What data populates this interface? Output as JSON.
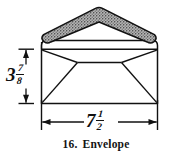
{
  "figure": {
    "caption_number": "16.",
    "caption_text": "Envelope",
    "object_name": "envelope",
    "line_color": "#111111",
    "flap_fill_color": "#9a9a9a",
    "background_color": "#ffffff"
  },
  "dimensions": {
    "height": {
      "whole": "3",
      "numerator": "7",
      "denominator": "8",
      "full_text": "3 7/8",
      "orientation": "vertical",
      "arrow_style": "double-arrow-with-extension-ticks"
    },
    "width": {
      "whole": "7",
      "numerator": "1",
      "denominator": "2",
      "full_text": "7 1/2",
      "orientation": "horizontal",
      "arrow_style": "double-arrow-with-extension-ticks"
    }
  },
  "drawing": {
    "body_label": "envelope-body",
    "flap_label": "envelope-flap",
    "fold_label": "envelope-fold-lines"
  }
}
